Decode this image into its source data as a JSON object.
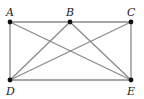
{
  "diagram": {
    "type": "geometry-figure",
    "colors": {
      "line": "#8a8a8a",
      "point": "#111111",
      "label": "#222222",
      "background": "#ffffff"
    },
    "points": [
      {
        "id": "A",
        "label": "A",
        "x": 10,
        "y": 22,
        "label_x": 6,
        "label_y": 16
      },
      {
        "id": "B",
        "label": "B",
        "x": 70,
        "y": 22,
        "label_x": 66,
        "label_y": 16
      },
      {
        "id": "C",
        "label": "C",
        "x": 131,
        "y": 22,
        "label_x": 127,
        "label_y": 16
      },
      {
        "id": "D",
        "label": "D",
        "x": 10,
        "y": 80,
        "label_x": 6,
        "label_y": 95
      },
      {
        "id": "E",
        "label": "E",
        "x": 131,
        "y": 80,
        "label_x": 127,
        "label_y": 95
      }
    ],
    "edges": [
      [
        "A",
        "C"
      ],
      [
        "D",
        "E"
      ],
      [
        "A",
        "D"
      ],
      [
        "C",
        "E"
      ],
      [
        "A",
        "E"
      ],
      [
        "B",
        "D"
      ],
      [
        "B",
        "E"
      ],
      [
        "C",
        "D"
      ]
    ]
  }
}
